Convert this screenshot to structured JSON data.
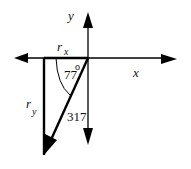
{
  "diagram": {
    "axes": {
      "x_label": "x",
      "y_label": "y"
    },
    "components": {
      "rx_label": "r",
      "rx_sub": "x",
      "ry_label": "r",
      "ry_sub": "y"
    },
    "vector": {
      "magnitude_label": "317",
      "angle_label": "77",
      "angle_unit": "o"
    },
    "colors": {
      "stroke": "#000000",
      "background": "#ffffff"
    }
  }
}
